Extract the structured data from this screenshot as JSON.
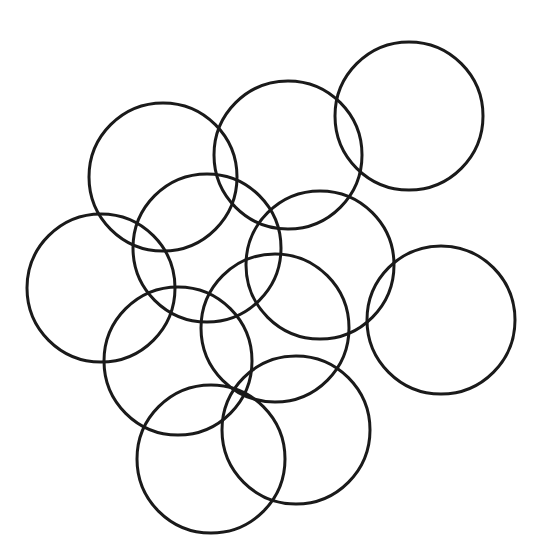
{
  "diagram": {
    "type": "overlapping-circles",
    "width": 541,
    "height": 552,
    "background": "#ffffff",
    "stroke_color": "#1a1a1a",
    "stroke_width": 3,
    "fill": "none",
    "circle_count": 11,
    "circles": [
      {
        "id": "top-right",
        "cx": 409,
        "cy": 116,
        "r": 74
      },
      {
        "id": "top-center",
        "cx": 288,
        "cy": 155,
        "r": 74
      },
      {
        "id": "upper-left",
        "cx": 163,
        "cy": 177,
        "r": 74
      },
      {
        "id": "left",
        "cx": 101,
        "cy": 288,
        "r": 74
      },
      {
        "id": "center-left",
        "cx": 207,
        "cy": 248,
        "r": 74
      },
      {
        "id": "center-right",
        "cx": 320,
        "cy": 265,
        "r": 74
      },
      {
        "id": "right",
        "cx": 441,
        "cy": 320,
        "r": 74
      },
      {
        "id": "middle",
        "cx": 275,
        "cy": 328,
        "r": 74
      },
      {
        "id": "lower-left",
        "cx": 178,
        "cy": 361,
        "r": 74
      },
      {
        "id": "bottom-left",
        "cx": 211,
        "cy": 459,
        "r": 74
      },
      {
        "id": "bottom-right",
        "cx": 296,
        "cy": 430,
        "r": 74
      }
    ]
  }
}
